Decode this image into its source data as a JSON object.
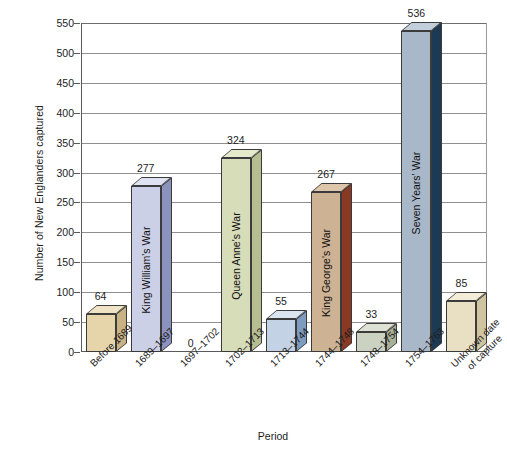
{
  "chart_data": {
    "type": "bar",
    "title": "",
    "xlabel": "Period",
    "ylabel": "Number of New Englanders captured",
    "ylim": [
      0,
      550
    ],
    "ytick_step": 50,
    "yticks": [
      0,
      50,
      100,
      150,
      200,
      250,
      300,
      350,
      400,
      450,
      500,
      550
    ],
    "grid": "horizontal",
    "legend": "none",
    "style": "3d-bar",
    "categories": [
      "Before 1689",
      "1689–1697",
      "1697–1702",
      "1702–1713",
      "1713–1744",
      "1744–1748",
      "1748–1754",
      "1754–1763",
      "Unknown date of capture"
    ],
    "values": [
      64,
      277,
      0,
      324,
      55,
      267,
      33,
      536,
      85
    ],
    "bars": [
      {
        "category": "Before 1689",
        "label_line1": "Before 1689",
        "label_line2": "",
        "value": 64,
        "value_label": "64",
        "war_label": "",
        "front_color": "#e3d3a8",
        "side_color": "#c3a householder"
      }
    ],
    "bar_items": [
      {
        "label_line1": "Before 1689",
        "label_line2": "",
        "value": 64,
        "value_label": "64",
        "war_label": "",
        "front_color": "#e6d5ab",
        "side_color": "#c9b283",
        "top_color": "#efe3c5"
      },
      {
        "label_line1": "1689–1697",
        "label_line2": "",
        "value": 277,
        "value_label": "277",
        "war_label": "King William's War",
        "front_color": "#ccd0e6",
        "side_color": "#8b92bd",
        "top_color": "#dfe2f0"
      },
      {
        "label_line1": "1697–1702",
        "label_line2": "",
        "value": 0,
        "value_label": "0",
        "war_label": "",
        "front_color": "#ffffff",
        "side_color": "#ffffff",
        "top_color": "#ffffff"
      },
      {
        "label_line1": "1702–1713",
        "label_line2": "",
        "value": 324,
        "value_label": "324",
        "war_label": "Queen Anne's War",
        "front_color": "#d7dcb9",
        "side_color": "#b6bd90",
        "top_color": "#e6eacd"
      },
      {
        "label_line1": "1713–1744",
        "label_line2": "",
        "value": 55,
        "value_label": "55",
        "war_label": "",
        "front_color": "#c3d2e4",
        "side_color": "#7e9cc0",
        "top_color": "#dbe5f0"
      },
      {
        "label_line1": "1744–1748",
        "label_line2": "",
        "value": 267,
        "value_label": "267",
        "war_label": "King George's War",
        "front_color": "#ceb294",
        "side_color": "#8a3a24",
        "top_color": "#ddc6ac"
      },
      {
        "label_line1": "1748–1754",
        "label_line2": "",
        "value": 33,
        "value_label": "33",
        "war_label": "",
        "front_color": "#ccd2c2",
        "side_color": "#a8b098",
        "top_color": "#dde2d5"
      },
      {
        "label_line1": "1754–1763",
        "label_line2": "",
        "value": 536,
        "value_label": "536",
        "war_label": "Seven Years' War",
        "front_color": "#a9b8c8",
        "side_color": "#1d3a55",
        "top_color": "#c2ced9"
      },
      {
        "label_line1": "Unknown date",
        "label_line2": "of capture",
        "value": 85,
        "value_label": "85",
        "war_label": "",
        "front_color": "#e9e0c4",
        "side_color": "#d0c4a0",
        "top_color": "#f2ecd8"
      }
    ]
  },
  "axis": {
    "y_title": "Number of New Englanders captured",
    "x_title": "Period",
    "y_tick_labels": [
      "550",
      "500",
      "450",
      "400",
      "350",
      "300",
      "250",
      "200",
      "150",
      "100",
      "50",
      "0"
    ]
  }
}
